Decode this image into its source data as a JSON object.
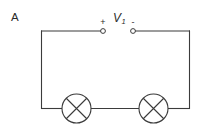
{
  "figure": {
    "panel_label": "A",
    "background_color": "#ffffff",
    "line_color": "#3b3b3b",
    "text_color": "#2b2b2b"
  },
  "meter": {
    "symbol": "V",
    "subscript": "1",
    "full_label": "V1",
    "positive_terminal_label": "+",
    "negative_terminal_label": "-"
  },
  "components": [
    {
      "type": "lamp",
      "name": "lamp-left",
      "symbol": "crossed-circle"
    },
    {
      "type": "lamp",
      "name": "lamp-right",
      "symbol": "crossed-circle"
    }
  ]
}
